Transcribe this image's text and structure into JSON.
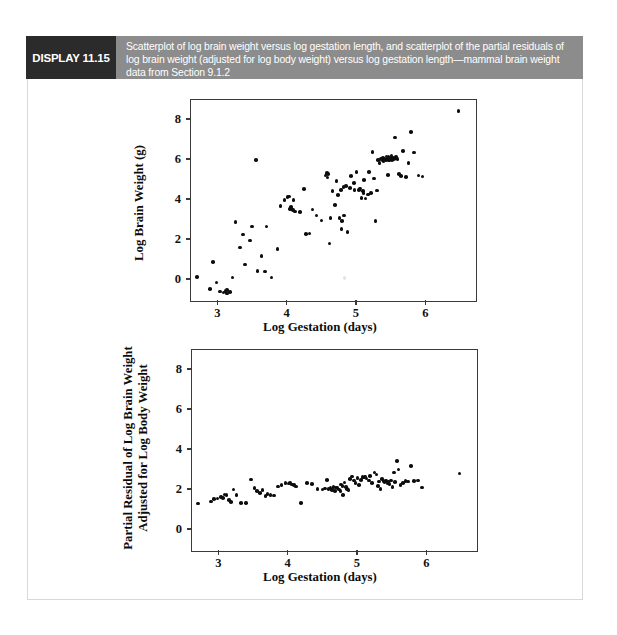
{
  "display": {
    "tag": "DISPLAY 11.15",
    "caption": "Scatterplot of log brain weight versus log gestation length, and scatterplot of the partial residuals of log brain weight (adjusted for log body weight) versus log gestation length—mammal brain weight data from Section 9.1.2",
    "tag_bg": "#2b2b2b",
    "band_bg": "#8c8c8c"
  },
  "chart_data": [
    {
      "type": "scatter",
      "title": "",
      "xlabel": "Log Gestation (days)",
      "ylabel": "Log Brain Weight (g)",
      "xlim": [
        2.62,
        6.72
      ],
      "ylim": [
        -1.05,
        8.95
      ],
      "xticks": [
        3,
        4,
        5,
        6
      ],
      "yticks": [
        0,
        2,
        4,
        6,
        8
      ],
      "xticklabels": [
        "3",
        "4",
        "5",
        "6"
      ],
      "yticklabels": [
        "0",
        "2",
        "4",
        "6",
        "8"
      ],
      "grid": false,
      "legend": null,
      "marker": "filled-circle",
      "marker_color": "#0d0d0d",
      "points": [
        [
          2.71,
          0.1
        ],
        [
          2.89,
          -0.49
        ],
        [
          2.94,
          0.87
        ],
        [
          2.99,
          -0.16
        ],
        [
          3.04,
          -0.62
        ],
        [
          3.09,
          -0.66
        ],
        [
          3.12,
          -0.6
        ],
        [
          3.14,
          -0.55
        ],
        [
          3.14,
          -0.72
        ],
        [
          3.18,
          -0.63
        ],
        [
          3.22,
          0.09
        ],
        [
          3.26,
          2.87
        ],
        [
          3.33,
          1.58
        ],
        [
          3.37,
          2.24
        ],
        [
          3.4,
          0.74
        ],
        [
          3.47,
          1.94
        ],
        [
          3.5,
          2.64
        ],
        [
          3.56,
          5.94
        ],
        [
          3.58,
          0.42
        ],
        [
          3.64,
          1.15
        ],
        [
          3.69,
          0.39
        ],
        [
          3.71,
          2.63
        ],
        [
          3.78,
          0.09
        ],
        [
          3.87,
          1.51
        ],
        [
          3.91,
          3.66
        ],
        [
          3.97,
          3.96
        ],
        [
          4.01,
          4.1
        ],
        [
          4.03,
          4.14
        ],
        [
          4.05,
          3.52
        ],
        [
          4.06,
          3.62
        ],
        [
          4.07,
          3.5
        ],
        [
          4.09,
          3.46
        ],
        [
          4.1,
          3.95
        ],
        [
          4.12,
          3.38
        ],
        [
          4.19,
          3.37
        ],
        [
          4.25,
          4.51
        ],
        [
          4.28,
          2.26
        ],
        [
          4.33,
          2.28
        ],
        [
          4.37,
          3.48
        ],
        [
          4.43,
          3.18
        ],
        [
          4.5,
          2.94
        ],
        [
          4.56,
          5.18
        ],
        [
          4.58,
          5.3
        ],
        [
          4.59,
          5.08
        ],
        [
          4.6,
          5.24
        ],
        [
          4.62,
          1.78
        ],
        [
          4.63,
          3.05
        ],
        [
          4.66,
          4.4
        ],
        [
          4.7,
          3.71
        ],
        [
          4.72,
          4.91
        ],
        [
          4.74,
          4.21
        ],
        [
          4.76,
          3.06
        ],
        [
          4.78,
          4.45
        ],
        [
          4.79,
          2.52
        ],
        [
          4.8,
          2.92
        ],
        [
          4.82,
          4.6
        ],
        [
          4.83,
          3.18
        ],
        [
          4.86,
          4.65
        ],
        [
          4.88,
          2.36
        ],
        [
          4.91,
          4.56
        ],
        [
          4.93,
          5.14
        ],
        [
          4.97,
          4.8
        ],
        [
          4.98,
          4.46
        ],
        [
          5.01,
          5.35
        ],
        [
          5.04,
          4.45
        ],
        [
          5.06,
          4.52
        ],
        [
          5.08,
          4.06
        ],
        [
          5.1,
          4.39
        ],
        [
          5.11,
          4.3
        ],
        [
          5.12,
          4.95
        ],
        [
          5.14,
          4.02
        ],
        [
          5.17,
          4.22
        ],
        [
          5.19,
          5.36
        ],
        [
          5.22,
          4.31
        ],
        [
          5.24,
          6.34
        ],
        [
          5.26,
          5.02
        ],
        [
          5.28,
          2.9
        ],
        [
          5.3,
          4.43
        ],
        [
          5.32,
          5.96
        ],
        [
          5.34,
          5.81
        ],
        [
          5.36,
          5.99
        ],
        [
          5.38,
          5.92
        ],
        [
          5.39,
          6.05
        ],
        [
          5.4,
          5.88
        ],
        [
          5.41,
          6.01
        ],
        [
          5.43,
          5.94
        ],
        [
          5.44,
          6.12
        ],
        [
          5.45,
          5.98
        ],
        [
          5.46,
          5.2
        ],
        [
          5.47,
          6.09
        ],
        [
          5.48,
          5.92
        ],
        [
          5.5,
          6.04
        ],
        [
          5.51,
          6.18
        ],
        [
          5.52,
          5.96
        ],
        [
          5.53,
          6.06
        ],
        [
          5.55,
          6.0
        ],
        [
          5.56,
          7.08
        ],
        [
          5.58,
          6.11
        ],
        [
          5.6,
          6.01
        ],
        [
          5.62,
          5.26
        ],
        [
          5.65,
          5.15
        ],
        [
          5.68,
          6.41
        ],
        [
          5.72,
          5.09
        ],
        [
          5.76,
          5.8
        ],
        [
          5.79,
          7.36
        ],
        [
          5.84,
          6.33
        ],
        [
          5.9,
          5.17
        ],
        [
          5.96,
          5.13
        ],
        [
          6.48,
          8.41
        ]
      ]
    },
    {
      "type": "scatter",
      "title": "",
      "xlabel": "Log Gestation (days)",
      "ylabel_line1": "Partial Residual of Log Brain Weight",
      "ylabel_line2": "Adjusted for Log Body Weight",
      "xlim": [
        2.62,
        6.72
      ],
      "ylim": [
        -1.05,
        8.95
      ],
      "xticks": [
        3,
        4,
        5,
        6
      ],
      "yticks": [
        0,
        2,
        4,
        6,
        8
      ],
      "xticklabels": [
        "3",
        "4",
        "5",
        "6"
      ],
      "yticklabels": [
        "0",
        "2",
        "4",
        "6",
        "8"
      ],
      "grid": false,
      "legend": null,
      "marker": "filled-circle",
      "marker_color": "#0d0d0d",
      "points": [
        [
          2.71,
          1.28
        ],
        [
          2.89,
          1.38
        ],
        [
          2.94,
          1.52
        ],
        [
          2.99,
          1.54
        ],
        [
          3.04,
          1.62
        ],
        [
          3.07,
          1.56
        ],
        [
          3.09,
          1.74
        ],
        [
          3.12,
          1.7
        ],
        [
          3.15,
          1.46
        ],
        [
          3.18,
          1.36
        ],
        [
          3.22,
          1.98
        ],
        [
          3.26,
          1.72
        ],
        [
          3.33,
          1.3
        ],
        [
          3.4,
          1.3
        ],
        [
          3.47,
          2.48
        ],
        [
          3.52,
          2.06
        ],
        [
          3.56,
          1.92
        ],
        [
          3.6,
          1.8
        ],
        [
          3.64,
          1.96
        ],
        [
          3.68,
          1.66
        ],
        [
          3.71,
          1.76
        ],
        [
          3.75,
          1.7
        ],
        [
          3.8,
          1.68
        ],
        [
          3.86,
          2.14
        ],
        [
          3.91,
          2.22
        ],
        [
          3.97,
          2.3
        ],
        [
          4.01,
          2.28
        ],
        [
          4.03,
          2.32
        ],
        [
          4.06,
          2.24
        ],
        [
          4.09,
          2.2
        ],
        [
          4.12,
          2.14
        ],
        [
          4.19,
          1.32
        ],
        [
          4.28,
          2.32
        ],
        [
          4.35,
          2.26
        ],
        [
          4.43,
          2.02
        ],
        [
          4.5,
          1.98
        ],
        [
          4.54,
          2.04
        ],
        [
          4.57,
          2.46
        ],
        [
          4.59,
          2.0
        ],
        [
          4.62,
          2.06
        ],
        [
          4.64,
          1.96
        ],
        [
          4.66,
          2.1
        ],
        [
          4.68,
          1.92
        ],
        [
          4.7,
          2.08
        ],
        [
          4.72,
          2.06
        ],
        [
          4.74,
          1.98
        ],
        [
          4.76,
          1.9
        ],
        [
          4.77,
          2.24
        ],
        [
          4.79,
          2.16
        ],
        [
          4.8,
          1.72
        ],
        [
          4.82,
          2.34
        ],
        [
          4.84,
          2.1
        ],
        [
          4.86,
          2.02
        ],
        [
          4.88,
          1.96
        ],
        [
          4.9,
          2.52
        ],
        [
          4.93,
          2.64
        ],
        [
          4.96,
          2.44
        ],
        [
          4.98,
          2.3
        ],
        [
          5.01,
          2.56
        ],
        [
          5.03,
          2.2
        ],
        [
          5.06,
          2.46
        ],
        [
          5.08,
          2.62
        ],
        [
          5.1,
          2.58
        ],
        [
          5.12,
          2.64
        ],
        [
          5.14,
          2.54
        ],
        [
          5.17,
          2.44
        ],
        [
          5.19,
          2.66
        ],
        [
          5.22,
          2.3
        ],
        [
          5.25,
          2.84
        ],
        [
          5.28,
          2.74
        ],
        [
          5.3,
          2.16
        ],
        [
          5.32,
          2.38
        ],
        [
          5.34,
          2.0
        ],
        [
          5.36,
          2.52
        ],
        [
          5.38,
          2.42
        ],
        [
          5.4,
          2.36
        ],
        [
          5.42,
          2.44
        ],
        [
          5.44,
          2.3
        ],
        [
          5.45,
          2.38
        ],
        [
          5.47,
          2.26
        ],
        [
          5.49,
          2.44
        ],
        [
          5.51,
          2.12
        ],
        [
          5.53,
          2.84
        ],
        [
          5.55,
          2.36
        ],
        [
          5.58,
          3.42
        ],
        [
          5.6,
          2.98
        ],
        [
          5.63,
          2.22
        ],
        [
          5.66,
          2.3
        ],
        [
          5.7,
          2.42
        ],
        [
          5.74,
          2.38
        ],
        [
          5.78,
          3.16
        ],
        [
          5.82,
          2.4
        ],
        [
          5.88,
          2.44
        ],
        [
          5.94,
          2.08
        ],
        [
          6.48,
          2.78
        ]
      ]
    }
  ]
}
